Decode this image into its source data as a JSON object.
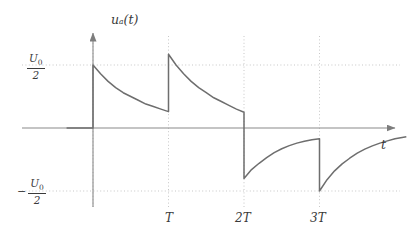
{
  "figure": {
    "background_color": "#ffffff",
    "curve_color": "#6e6e6e",
    "axis_color": "#8a8a8a",
    "grid_color": "#b9b9b9",
    "text_color": "#3a3a3a"
  },
  "axis": {
    "y_title": "u_a(t)",
    "y_title_base": "u",
    "y_title_sub": "a",
    "y_title_tail": "(t)",
    "x_title": "t"
  },
  "y_ticks": [
    {
      "sign": "",
      "numerator": "U",
      "numerator_sub": "0",
      "denominator": "2",
      "value": 0.5
    },
    {
      "sign": "−",
      "numerator": "U",
      "numerator_sub": "0",
      "denominator": "2",
      "value": -0.5
    }
  ],
  "x_ticks": [
    {
      "label": "T",
      "value": 1
    },
    {
      "label": "2T",
      "value": 2
    },
    {
      "label": "3T",
      "value": 3
    }
  ],
  "chart_data": {
    "type": "line",
    "title": "",
    "subtitle": "",
    "xlabel": "t",
    "ylabel": "u_a(t)",
    "xlim": [
      -0.35,
      4.3
    ],
    "ylim": [
      -0.78,
      0.78
    ],
    "grid": true,
    "grid_style": "dotted",
    "legend": "none",
    "y_tick_labels": [
      "U_0/2",
      "-U_0/2"
    ],
    "y_tick_values": [
      0.5,
      -0.5
    ],
    "x_tick_labels": [
      "T",
      "2T",
      "3T"
    ],
    "x_tick_values": [
      1,
      2,
      3
    ],
    "series": [
      {
        "name": "u_a(t)",
        "color": "#6e6e6e",
        "segments": [
          {
            "name": "pre-start-zero",
            "type": "constant",
            "x_start": -0.35,
            "x_end": 0.0,
            "y": 0.0,
            "points": [
              [
                -0.35,
                0.0
              ],
              [
                0.0,
                0.0
              ]
            ]
          },
          {
            "name": "jump-up-at-0",
            "type": "vertical-jump",
            "x": 0.0,
            "y_from": 0.0,
            "y_to": 0.5
          },
          {
            "name": "decay-0-to-T",
            "type": "exponential-decay",
            "x_start": 0.0,
            "x_end": 1.0,
            "y_start": 0.5,
            "y_end": 0.13,
            "points": [
              [
                0.0,
                0.5
              ],
              [
                0.1,
                0.43
              ],
              [
                0.2,
                0.37
              ],
              [
                0.3,
                0.32
              ],
              [
                0.4,
                0.28
              ],
              [
                0.5,
                0.25
              ],
              [
                0.6,
                0.22
              ],
              [
                0.7,
                0.19
              ],
              [
                0.8,
                0.17
              ],
              [
                0.9,
                0.15
              ],
              [
                1.0,
                0.13
              ]
            ]
          },
          {
            "name": "jump-up-at-T",
            "type": "vertical-jump",
            "x": 1.0,
            "y_from": 0.13,
            "y_to": 0.585
          },
          {
            "name": "decay-T-to-2T",
            "type": "exponential-decay",
            "x_start": 1.0,
            "x_end": 2.0,
            "y_start": 0.585,
            "y_end": 0.125,
            "points": [
              [
                1.0,
                0.585
              ],
              [
                1.1,
                0.5
              ],
              [
                1.2,
                0.43
              ],
              [
                1.3,
                0.37
              ],
              [
                1.4,
                0.32
              ],
              [
                1.5,
                0.28
              ],
              [
                1.6,
                0.24
              ],
              [
                1.7,
                0.21
              ],
              [
                1.8,
                0.18
              ],
              [
                1.9,
                0.15
              ],
              [
                2.0,
                0.125
              ]
            ]
          },
          {
            "name": "jump-down-at-2T",
            "type": "vertical-jump",
            "x": 2.0,
            "y_from": 0.125,
            "y_to": -0.4
          },
          {
            "name": "rise-2T-to-3T",
            "type": "exponential-rise",
            "x_start": 2.0,
            "x_end": 3.0,
            "y_start": -0.4,
            "y_end": -0.085,
            "points": [
              [
                2.0,
                -0.4
              ],
              [
                2.1,
                -0.33
              ],
              [
                2.2,
                -0.28
              ],
              [
                2.3,
                -0.235
              ],
              [
                2.4,
                -0.195
              ],
              [
                2.5,
                -0.165
              ],
              [
                2.6,
                -0.14
              ],
              [
                2.7,
                -0.12
              ],
              [
                2.8,
                -0.105
              ],
              [
                2.9,
                -0.093
              ],
              [
                3.0,
                -0.085
              ]
            ]
          },
          {
            "name": "jump-down-at-3T",
            "type": "vertical-jump",
            "x": 3.0,
            "y_from": -0.085,
            "y_to": -0.5
          },
          {
            "name": "rise-after-3T",
            "type": "exponential-rise",
            "x_start": 3.0,
            "x_end": 4.15,
            "y_start": -0.5,
            "y_end": -0.07,
            "points": [
              [
                3.0,
                -0.5
              ],
              [
                3.1,
                -0.41
              ],
              [
                3.2,
                -0.34
              ],
              [
                3.3,
                -0.285
              ],
              [
                3.4,
                -0.24
              ],
              [
                3.5,
                -0.2
              ],
              [
                3.6,
                -0.168
              ],
              [
                3.7,
                -0.142
              ],
              [
                3.8,
                -0.12
              ],
              [
                3.9,
                -0.102
              ],
              [
                4.0,
                -0.085
              ],
              [
                4.15,
                -0.07
              ]
            ]
          }
        ]
      }
    ]
  }
}
